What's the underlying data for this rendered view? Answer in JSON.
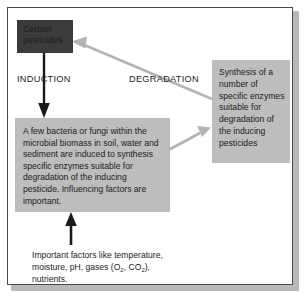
{
  "figure": {
    "type": "process-flow-diagram",
    "background_color": "#ffffff",
    "frame_color": "#4a4a4a"
  },
  "nodes": {
    "pesticides_box": {
      "label": "Certain pesticides",
      "fill": "#3b3b3b",
      "text_color": "#1b1b1b"
    },
    "microbes_box": {
      "label": "A few bacteria or fungi within the microbial biomass in soil, water and sediment are induced to synthesis specific enzymes suitable for degradation of the inducing pesticide. Influencing factors are important.",
      "fill": "#bdbdbd",
      "text_color": "#1c1c1c"
    },
    "enzymes_box": {
      "label": "Synthesis of a number of specific enzymes suitable for degradation of the inducing pesticides",
      "fill": "#bdbdbd",
      "text_color": "#1c1c1c"
    }
  },
  "labels": {
    "induction": "INDUCTION",
    "degradation": "DEGRADATION"
  },
  "caption": {
    "line1": "Important factors like temperature,",
    "line2_a": "moisture, pH, gases (O",
    "line2_sub1": "2",
    "line2_b": ", CO",
    "line2_sub2": "2",
    "line2_c": "),",
    "line3": "nutrients."
  },
  "arrows": {
    "induction_arrow": {
      "name": "induction-arrow",
      "color": "#1a1a1a",
      "from": "pesticides_box",
      "to": "microbes_box",
      "direction": "down"
    },
    "degradation_arrow": {
      "name": "degradation-arrow",
      "color": "#b0b0b0",
      "from": "enzymes_box",
      "to": "pesticides_box",
      "direction": "up-left"
    },
    "synthesis_arrow": {
      "name": "synthesis-arrow",
      "color": "#b0b0b0",
      "from": "microbes_box",
      "to": "enzymes_box",
      "direction": "up-right"
    },
    "factors_arrow": {
      "name": "factors-arrow",
      "color": "#1a1a1a",
      "from": "caption",
      "to": "microbes_box",
      "direction": "up"
    }
  }
}
